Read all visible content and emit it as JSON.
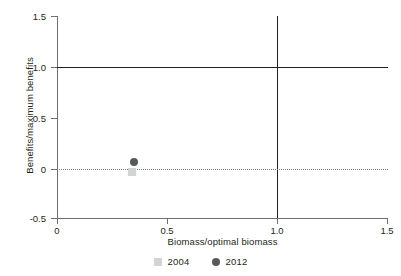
{
  "chart_data": {
    "type": "scatter",
    "title": "",
    "xlabel": "Biomass/optimal biomass",
    "ylabel": "Benefits/maximum benefits",
    "xlim": [
      0,
      1.5
    ],
    "ylim": [
      -0.5,
      1.5
    ],
    "xticks": [
      "0",
      "0.5",
      "1.0",
      "1.5"
    ],
    "xtick_values": [
      0,
      0.5,
      1.0,
      1.5
    ],
    "yticks": [
      "1.5",
      "1.0",
      "0.5",
      "0",
      "-0.5"
    ],
    "ytick_values": [
      1.5,
      1.0,
      0.5,
      0,
      -0.5
    ],
    "grid": false,
    "legend_position": "bottom-center",
    "reference_lines": [
      {
        "name": "optimal-benefits-line",
        "orientation": "horizontal",
        "value": 1.0,
        "style": "solid",
        "color": "#231f20"
      },
      {
        "name": "optimal-biomass-line",
        "orientation": "vertical",
        "value": 1.0,
        "style": "solid",
        "color": "#231f20"
      },
      {
        "name": "zero-benefits-line",
        "orientation": "horizontal",
        "value": 0,
        "style": "dotted",
        "color": "#7b7b7b"
      }
    ],
    "series": [
      {
        "name": "2004",
        "marker": "square",
        "color": "#d2d3d5",
        "points": [
          {
            "x": 0.34,
            "y": -0.04
          }
        ]
      },
      {
        "name": "2012",
        "marker": "circle",
        "color": "#58595b",
        "points": [
          {
            "x": 0.35,
            "y": 0.05
          }
        ]
      }
    ]
  },
  "legend": {
    "items": [
      {
        "label": "2004",
        "marker": "square",
        "color": "#d2d3d5"
      },
      {
        "label": "2012",
        "marker": "circle",
        "color": "#58595b"
      }
    ]
  },
  "colors": {
    "axis": "#6d6e71",
    "reference": "#231f20",
    "zero": "#7b7b7b",
    "text": "#231f20",
    "background": "#ffffff"
  }
}
